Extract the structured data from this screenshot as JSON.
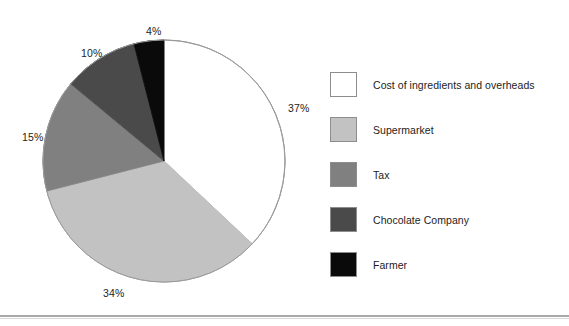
{
  "chart_data": {
    "type": "pie",
    "title": "",
    "categories": [
      "Cost of ingredients and overheads",
      "Supermarket",
      "Tax",
      "Chocolate Company",
      "Farmer"
    ],
    "values": [
      37,
      34,
      15,
      10,
      4
    ],
    "value_labels": [
      "37%",
      "34%",
      "15%",
      "10%",
      "4%"
    ],
    "colors": [
      "#ffffff",
      "#c2c2c2",
      "#808080",
      "#4a4a4a",
      "#0a0a0a"
    ],
    "outline_color": "#9a9a9a",
    "units": "percent",
    "start_angle_deg": 0,
    "direction": "clockwise",
    "legend_position": "right",
    "grid": false,
    "xlabel": "",
    "ylabel": ""
  },
  "legend": {
    "items": [
      {
        "label": "Cost of ingredients and overheads",
        "color": "#ffffff"
      },
      {
        "label": "Supermarket",
        "color": "#c2c2c2"
      },
      {
        "label": "Tax",
        "color": "#808080"
      },
      {
        "label": "Chocolate Company",
        "color": "#4a4a4a"
      },
      {
        "label": "Farmer",
        "color": "#0a0a0a"
      }
    ]
  },
  "pie_labels": [
    {
      "text": "37%",
      "left": 288,
      "top": 102
    },
    {
      "text": "34%",
      "left": 103,
      "top": 287
    },
    {
      "text": "15%",
      "left": 22,
      "top": 131
    },
    {
      "text": "10%",
      "left": 81,
      "top": 47
    },
    {
      "text": "4%",
      "left": 146,
      "top": 25
    }
  ]
}
